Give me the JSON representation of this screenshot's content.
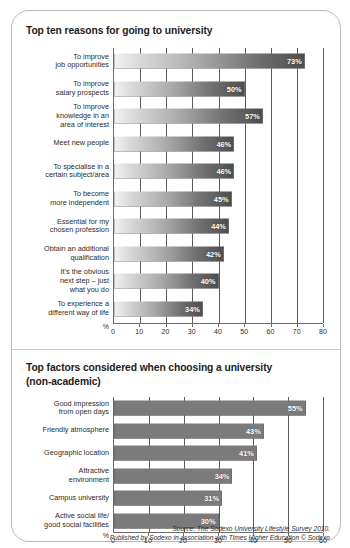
{
  "card": {
    "border_color": "#b9b9b9"
  },
  "panels": [
    {
      "id": "reasons",
      "title": "Top ten reasons for going to university",
      "subtitle": "",
      "axis_unit": "%",
      "bar_style": "gradient"
    },
    {
      "id": "factors",
      "title": "Top factors considered when choosing a university",
      "subtitle": "(non-academic)",
      "axis_unit": "%",
      "bar_style": "flat"
    }
  ],
  "source": {
    "line1": "Source: The Sodexo University Lifestyle Survey 2010.",
    "line2": "Published by Sodexo in association with Times Higher Education © Sodexo"
  },
  "chart_data": [
    {
      "type": "bar",
      "orientation": "horizontal",
      "title": "Top ten reasons for going to university",
      "xlabel": "%",
      "ylabel": "",
      "xlim": [
        0,
        80
      ],
      "xticks": [
        0,
        10,
        20,
        30,
        40,
        50,
        60,
        70,
        80
      ],
      "grid": true,
      "legend": false,
      "bar_color": "#6f6f6f",
      "categories": [
        "To improve\njob opportunities",
        "To improve\nsalary prospects",
        "To improve\nknowledge in an\narea of interest",
        "Meet new people",
        "To specialise in a\ncertain subject/area",
        "To become\nmore independent",
        "Essential for my\nchosen profession",
        "Obtain an additional\nqualification",
        "It's the obvious\nnext step – just\nwhat you do",
        "To experience a\ndifferent way of life"
      ],
      "values": [
        73,
        50,
        57,
        46,
        46,
        45,
        44,
        42,
        40,
        34
      ],
      "data_labels": [
        "73%",
        "50%",
        "57%",
        "46%",
        "46%",
        "45%",
        "44%",
        "42%",
        "40%",
        "34%"
      ]
    },
    {
      "type": "bar",
      "orientation": "horizontal",
      "title": "Top factors considered when choosing a university (non-academic)",
      "xlabel": "%",
      "ylabel": "",
      "xlim": [
        0,
        60
      ],
      "xticks": [
        0,
        10,
        20,
        30,
        40,
        50,
        60
      ],
      "grid": true,
      "legend": false,
      "bar_color": "#7b7b7b",
      "categories": [
        "Good impression\nfrom open days",
        "Friendly atmosphere",
        "Geographic location",
        "Attractive\nenvironment",
        "Campus university",
        "Active social life/\ngood social facilities"
      ],
      "values": [
        55,
        43,
        41,
        34,
        31,
        30
      ],
      "data_labels": [
        "55%",
        "43%",
        "41%",
        "34%",
        "31%",
        "30%"
      ]
    }
  ]
}
